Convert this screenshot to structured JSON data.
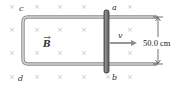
{
  "diagram": {
    "field": {
      "symbol": "B",
      "direction": "into-page",
      "marker": "×",
      "marker_color": "#c8c8c8",
      "grid_x": [
        12,
        37,
        60,
        84,
        130
      ],
      "grid_y": [
        6,
        29,
        52,
        76
      ]
    },
    "labels": {
      "c": "c",
      "d": "d",
      "a": "a",
      "b": "b",
      "velocity": "v",
      "field": "B"
    },
    "dimension": {
      "text": "50.0 cm",
      "value": 50.0,
      "unit": "cm"
    },
    "colors": {
      "rail": "#b8b8b8",
      "rail_edge": "#8a8a8a",
      "rod": "#6e6e6e",
      "rod_edge": "#3a3a3a",
      "arrow": "#8c8c8c",
      "text": "#333333"
    }
  }
}
